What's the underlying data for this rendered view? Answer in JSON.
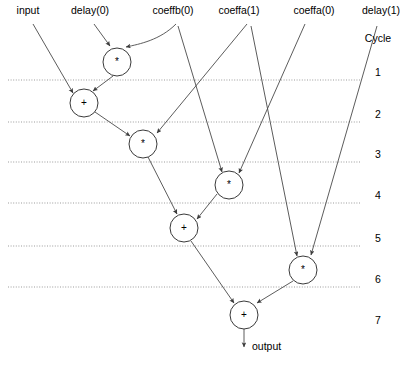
{
  "diagram": {
    "background_color": "#ffffff",
    "line_color": "#4a4a4a",
    "cycle_line_color": "#8a8a8a",
    "node_stroke_color": "#3a3a3a",
    "cycle_axis_label": "Cycle",
    "inputs": [
      {
        "id": "input",
        "label": "input",
        "x": 28,
        "y": 14
      },
      {
        "id": "delay0",
        "label": "delay(0)",
        "x": 90,
        "y": 14
      },
      {
        "id": "coeffb0",
        "label": "coeffb(0)",
        "x": 173,
        "y": 14
      },
      {
        "id": "coeffa1",
        "label": "coeffa(1)",
        "x": 239,
        "y": 14
      },
      {
        "id": "coeffa0",
        "label": "coeffa(0)",
        "x": 314,
        "y": 14
      },
      {
        "id": "delay1",
        "label": "delay(1)",
        "x": 381,
        "y": 14
      }
    ],
    "output": {
      "id": "output",
      "label": "output",
      "x": 252,
      "y": 350
    },
    "nodes": [
      {
        "id": "m1",
        "op": "*",
        "cx": 117,
        "cy": 62,
        "r": 14,
        "cycle": 1
      },
      {
        "id": "a1",
        "op": "+",
        "cx": 84,
        "cy": 103,
        "r": 14,
        "cycle": 2
      },
      {
        "id": "m2",
        "op": "*",
        "cx": 143,
        "cy": 144,
        "r": 14,
        "cycle": 3
      },
      {
        "id": "m3",
        "op": "*",
        "cx": 229,
        "cy": 185,
        "r": 14,
        "cycle": 4
      },
      {
        "id": "a2",
        "op": "+",
        "cx": 184,
        "cy": 228,
        "r": 14,
        "cycle": 5
      },
      {
        "id": "m4",
        "op": "*",
        "cx": 303,
        "cy": 270,
        "r": 14,
        "cycle": 6
      },
      {
        "id": "a3",
        "op": "+",
        "cx": 244,
        "cy": 315,
        "r": 14,
        "cycle": 7
      }
    ],
    "cycle_lines": [
      {
        "number": "1",
        "y": 80,
        "x1": 8,
        "x2": 361,
        "label_x": 378,
        "label_y": 76
      },
      {
        "number": "2",
        "y": 122,
        "x1": 8,
        "x2": 361,
        "label_x": 378,
        "label_y": 118
      },
      {
        "number": "3",
        "y": 162,
        "x1": 8,
        "x2": 361,
        "label_x": 378,
        "label_y": 158
      },
      {
        "number": "4",
        "y": 203,
        "x1": 8,
        "x2": 361,
        "label_x": 378,
        "label_y": 199
      },
      {
        "number": "5",
        "y": 246,
        "x1": 8,
        "x2": 361,
        "label_x": 378,
        "label_y": 242
      },
      {
        "number": "6",
        "y": 287,
        "x1": 8,
        "x2": 361,
        "label_x": 378,
        "label_y": 283
      },
      {
        "number": "7",
        "y": null,
        "x1": null,
        "x2": null,
        "label_x": 378,
        "label_y": 324
      }
    ],
    "cycle_axis_label_pos": {
      "x": 378,
      "y": 42
    },
    "edges": [
      {
        "id": "e-input-a1",
        "from": "input",
        "to": "a1",
        "kind": "line",
        "path": "M 33 24 L 73 93"
      },
      {
        "id": "e-delay0-m1",
        "from": "delay0",
        "to": "m1",
        "kind": "line",
        "path": "M 94 24 L 110 46"
      },
      {
        "id": "e-coeffb0-m1",
        "from": "coeffb0",
        "to": "m1",
        "kind": "curve",
        "path": "M 176 24 C 160 40 140 44 126 47"
      },
      {
        "id": "e-m1-a1",
        "from": "m1",
        "to": "a1",
        "kind": "line",
        "path": "M 113 76 L 93 91"
      },
      {
        "id": "e-a1-m2",
        "from": "a1",
        "to": "m2",
        "kind": "line",
        "path": "M 95 112 L 130 136"
      },
      {
        "id": "e-coeffa1-m2",
        "from": "coeffa1",
        "to": "m2",
        "kind": "line",
        "path": "M 247 24 L 157 133"
      },
      {
        "id": "e-m2-a2",
        "from": "m2",
        "to": "a2",
        "kind": "line",
        "path": "M 148 157 L 177 214"
      },
      {
        "id": "e-coeffb0-m3",
        "from": "coeffb0",
        "to": "m3",
        "kind": "line",
        "path": "M 178 26 L 222 172"
      },
      {
        "id": "e-coeffa0-m3",
        "from": "coeffa0",
        "to": "m3",
        "kind": "line",
        "path": "M 305 24 L 239 173"
      },
      {
        "id": "e-m3-a2",
        "from": "m3",
        "to": "a2",
        "kind": "line",
        "path": "M 217 194 L 197 219"
      },
      {
        "id": "e-coeffa1-m4",
        "from": "coeffa1",
        "to": "m4",
        "kind": "line",
        "path": "M 251 26 L 297 256"
      },
      {
        "id": "e-delay1-m4",
        "from": "delay1",
        "to": "m4",
        "kind": "line",
        "path": "M 377 26 L 311 255"
      },
      {
        "id": "e-a2-a3",
        "from": "a2",
        "to": "a3",
        "kind": "line",
        "path": "M 191 241 L 234 303"
      },
      {
        "id": "e-m4-a3",
        "from": "m4",
        "to": "a3",
        "kind": "line",
        "path": "M 293 281 L 257 303"
      },
      {
        "id": "e-a3-output",
        "from": "a3",
        "to": "output",
        "kind": "line",
        "path": "M 244 329 L 244 347"
      }
    ]
  }
}
